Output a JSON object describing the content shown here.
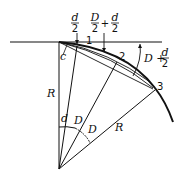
{
  "diagram": {
    "labels": {
      "d_half_num": "d",
      "d_half_den": "2",
      "D_half_num": "D",
      "D_half_den": "2",
      "plus1": "+",
      "d_half2_num": "d",
      "d_half2_den": "2",
      "D_plus": "D +",
      "d_half3_num": "d",
      "d_half3_den": "2",
      "c": "c",
      "R_left": "R",
      "R_right": "R",
      "angle_d": "d",
      "angle_D1": "D",
      "angle_D2": "D",
      "point1": "1",
      "point2": "2",
      "point3": "3"
    }
  }
}
